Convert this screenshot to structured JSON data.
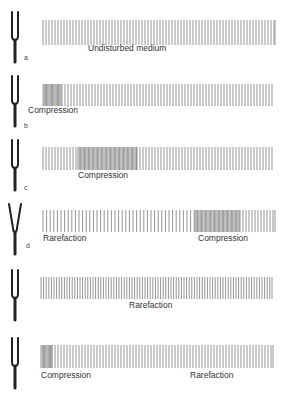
{
  "figure": {
    "colors": {
      "background": "#ffffff",
      "line": "#8a8a8a",
      "fork": "#222222",
      "text": "#333333"
    },
    "rows": [
      {
        "id": "a",
        "letter": "a",
        "top": 6,
        "fork_state": "rest",
        "band": {
          "x0": 43,
          "x1": 275,
          "y": 14,
          "h": 25
        },
        "density": [
          {
            "from": 43,
            "to": 275,
            "gap": 3.0
          }
        ],
        "labels": [
          {
            "text": "Undisturbed medium",
            "x": 88,
            "y": 44
          }
        ]
      },
      {
        "id": "b",
        "letter": "b",
        "top": 70,
        "fork_state": "right",
        "band": {
          "x0": 43,
          "x1": 272,
          "y": 14,
          "h": 22
        },
        "density": [
          {
            "from": 43,
            "to": 62,
            "gap": 1.2
          },
          {
            "from": 62,
            "to": 272,
            "gap": 3.0
          }
        ],
        "labels": [
          {
            "text": "Compression",
            "x": 28,
            "y": 38
          }
        ]
      },
      {
        "id": "c",
        "letter": "c",
        "top": 134,
        "fork_state": "rest",
        "band": {
          "x0": 43,
          "x1": 272,
          "y": 13,
          "h": 23
        },
        "density": [
          {
            "from": 43,
            "to": 78,
            "gap": 3.0
          },
          {
            "from": 78,
            "to": 137,
            "gap": 1.3
          },
          {
            "from": 137,
            "to": 272,
            "gap": 3.0
          }
        ],
        "labels": [
          {
            "text": "Compression",
            "x": 78,
            "y": 38
          }
        ]
      },
      {
        "id": "d",
        "letter": "d",
        "top": 198,
        "fork_state": "spread",
        "band": {
          "x0": 43,
          "x1": 275,
          "y": 12,
          "h": 22
        },
        "density": [
          {
            "from": 43,
            "to": 195,
            "gap": 3.6
          },
          {
            "from": 195,
            "to": 240,
            "gap": 1.3
          },
          {
            "from": 240,
            "to": 275,
            "gap": 3.0
          }
        ],
        "labels": [
          {
            "text": "Rarefaction",
            "x": 43,
            "y": 36
          },
          {
            "text": "Compression",
            "x": 198,
            "y": 36
          }
        ]
      },
      {
        "id": "e",
        "letter": "",
        "top": 264,
        "fork_state": "rest",
        "band": {
          "x0": 41,
          "x1": 272,
          "y": 13,
          "h": 22
        },
        "density": [
          {
            "from": 41,
            "to": 272,
            "gap": 2.6
          }
        ],
        "labels": [
          {
            "text": "Rarefaction",
            "x": 129,
            "y": 38
          }
        ]
      },
      {
        "id": "f",
        "letter": "",
        "top": 332,
        "fork_state": "rest",
        "band": {
          "x0": 41,
          "x1": 273,
          "y": 13,
          "h": 23
        },
        "density": [
          {
            "from": 41,
            "to": 52,
            "gap": 1.2
          },
          {
            "from": 52,
            "to": 273,
            "gap": 3.0
          }
        ],
        "labels": [
          {
            "text": "Compression",
            "x": 41,
            "y": 40
          },
          {
            "text": "Rarefaction",
            "x": 190,
            "y": 40
          }
        ]
      }
    ]
  }
}
